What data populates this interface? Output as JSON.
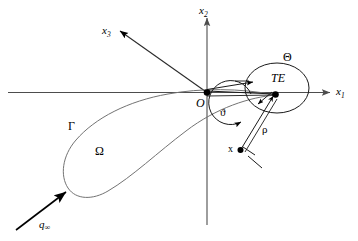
{
  "figure": {
    "background_color": "#ffffff",
    "line_color": "#000000",
    "curve_color": "#6b6b6b",
    "axis_color": "#4d4d4d"
  },
  "axes": {
    "x1": {
      "label": "x",
      "subscript": "1",
      "name": "axis-x1"
    },
    "x2": {
      "label": "x",
      "subscript": "2",
      "name": "axis-x2"
    },
    "x3": {
      "label": "x",
      "subscript": "3",
      "name": "axis-x3"
    }
  },
  "points": {
    "origin": {
      "label": "O"
    },
    "trailing_edge": {
      "label": "TE"
    },
    "field_point": {
      "label": "x"
    }
  },
  "regions": {
    "boundary": {
      "label": "Γ"
    },
    "domain": {
      "label": "Ω"
    },
    "te_neighborhood": {
      "label": "Θ"
    }
  },
  "measures": {
    "angle": {
      "label": "ϑ"
    },
    "radius": {
      "label": "ρ"
    }
  },
  "flow": {
    "freestream": {
      "label": "q",
      "subscript": "∞"
    }
  }
}
